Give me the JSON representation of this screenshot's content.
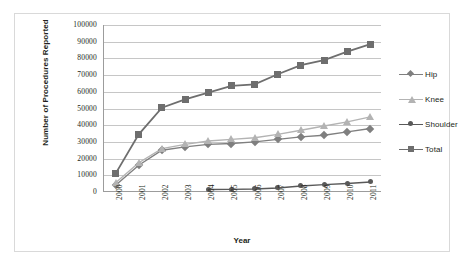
{
  "chart_data": {
    "type": "line",
    "title": "",
    "xlabel": "Year",
    "ylabel": "Number of Procedures Reported",
    "categories": [
      "2000",
      "2001",
      "2002",
      "2003",
      "2004",
      "2005",
      "2006",
      "2007",
      "2008",
      "2009",
      "2010",
      "2011"
    ],
    "ylim": [
      0,
      100000
    ],
    "ytick_labels": [
      "100000",
      "90000",
      "80000",
      "70000",
      "60000",
      "50000",
      "40000",
      "30000",
      "20000",
      "10000",
      "0"
    ],
    "ytick_values": [
      100000,
      90000,
      80000,
      70000,
      60000,
      50000,
      40000,
      30000,
      20000,
      10000,
      0
    ],
    "grid": "horizontal",
    "legend_position": "right",
    "series": [
      {
        "name": "Hip",
        "marker": "diamond",
        "color": "#7f7f7f",
        "values": [
          4000,
          16000,
          25000,
          27000,
          28500,
          29000,
          30000,
          31500,
          33000,
          34000,
          36000,
          38000
        ]
      },
      {
        "name": "Knee",
        "marker": "triangle",
        "color": "#b3b3b3",
        "values": [
          5500,
          17500,
          26000,
          28500,
          30500,
          31500,
          32500,
          34500,
          37000,
          39500,
          42000,
          45000
        ]
      },
      {
        "name": "Shoulder",
        "marker": "circle",
        "color": "#595959",
        "values": [
          null,
          null,
          null,
          null,
          1500,
          1600,
          1800,
          2400,
          3600,
          4400,
          5100,
          6000
        ]
      },
      {
        "name": "Total",
        "marker": "square",
        "color": "#6e6e6e",
        "values": [
          11000,
          34500,
          50500,
          55500,
          59500,
          63500,
          64500,
          70500,
          76000,
          79000,
          84000,
          88500
        ]
      }
    ]
  },
  "legend": {
    "items": [
      {
        "label": "Hip"
      },
      {
        "label": "Knee"
      },
      {
        "label": "Shoulder"
      },
      {
        "label": "Total"
      }
    ]
  },
  "axis": {
    "x_title": "Year",
    "y_title": "Number of Procedures Reported"
  },
  "colors": {
    "hip": "#7f7f7f",
    "knee": "#b3b3b3",
    "shoulder": "#595959",
    "total": "#6e6e6e",
    "gridline": "#c6c6c6",
    "axis": "#9c9c9c",
    "border": "#d9d9d9",
    "text": "#231f20",
    "background": "#ffffff"
  }
}
